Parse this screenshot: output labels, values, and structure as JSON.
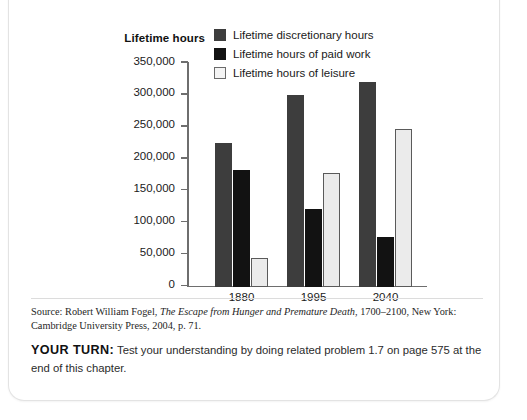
{
  "chart_data": {
    "type": "bar",
    "title": "Lifetime hours",
    "ylabel": "Lifetime hours",
    "xlabel": "",
    "categories": [
      "1880",
      "1995",
      "2040"
    ],
    "ylim": [
      0,
      350000
    ],
    "yticks": [
      0,
      50000,
      100000,
      150000,
      200000,
      250000,
      300000,
      350000
    ],
    "ytick_labels": [
      "0",
      "50,000",
      "100,000",
      "150,000",
      "200,000",
      "250,000",
      "300,000",
      "350,000"
    ],
    "grid": false,
    "legend_position": "top-center",
    "series": [
      {
        "name": "Lifetime discretionary hours",
        "color": "#3d3d3d",
        "values": [
          225000,
          300000,
          321000
        ]
      },
      {
        "name": "Lifetime hours of paid work",
        "color": "#121212",
        "values": [
          182000,
          122000,
          77000
        ]
      },
      {
        "name": "Lifetime hours of leisure",
        "color": "#ebebeb",
        "values": [
          45000,
          177000,
          247000
        ]
      }
    ]
  },
  "source": {
    "prefix": "Source: Robert William Fogel, ",
    "italic_title": "The Escape from Hunger and Premature Death",
    "suffix": ", 1700–2100, New York: Cambridge University Press, 2004, p. 71."
  },
  "your_turn": {
    "label": "YOUR TURN:",
    "text": " Test your understanding by doing related problem 1.7 on page 575 at the end of this chapter."
  }
}
